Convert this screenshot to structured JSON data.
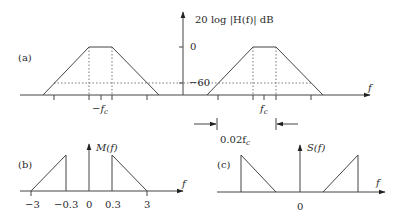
{
  "figure": {
    "panel_a": {
      "label": "(a)",
      "y_axis_label": "20 log |H(f)| dB",
      "y_ticks": [
        "0",
        "−60"
      ],
      "x_axis_label": "f",
      "left_center_label": "−f",
      "left_center_sub": "c",
      "right_center_label": "f",
      "right_center_sub": "c",
      "bandwidth_annotation": "0.02f",
      "bandwidth_sub": "c"
    },
    "panel_b": {
      "label": "(b)",
      "y_axis_label": "M(f)",
      "x_axis_label": "f",
      "x_ticks": [
        "−3",
        "−0.3",
        "0",
        "0.3",
        "3"
      ]
    },
    "panel_c": {
      "label": "(c)",
      "y_axis_label": "S(f)",
      "x_axis_label": "f",
      "x_ticks": [
        "0"
      ]
    }
  }
}
